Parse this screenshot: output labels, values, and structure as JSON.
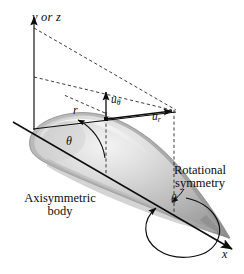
{
  "figure": {
    "background_color": "#ffffff",
    "line_color": "#0d0d0d",
    "body_fill_light": "#e8e8e8",
    "body_fill_mid": "#c2c2c2",
    "body_fill_dark": "#9a9a9a"
  },
  "labels": {
    "vertical_axis": "y or z",
    "horizontal_axis": "x",
    "radial_distance": "r",
    "polar_angle": "θ",
    "rotation_angle": "θ",
    "velocity_theta_base": "u",
    "velocity_theta_sub": "θ",
    "velocity_radial_base": "u",
    "velocity_radial_sub": "r",
    "rotational_symmetry_line1": "Rotational",
    "rotational_symmetry_line2": "symmetry",
    "body_line1": "Axisymmetric",
    "body_line2": "body"
  },
  "diagram_elements": {
    "origin": "coordinate-origin",
    "axes": [
      "y-or-z-axis",
      "x-axis"
    ],
    "vectors": [
      "u-theta-vector",
      "u-r-vector"
    ],
    "construction_lines": "dashed-projection-lines",
    "rotation_arrow": "circular-rotation-arrow",
    "shape": "teardrop-axisymmetric-body"
  }
}
